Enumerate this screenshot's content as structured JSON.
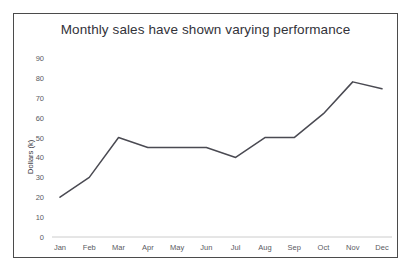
{
  "chart_data": {
    "type": "line",
    "title": "Monthly sales have shown varying performance",
    "xlabel": "",
    "ylabel": "Dollars (k)",
    "categories": [
      "Jan",
      "Feb",
      "Mar",
      "Apr",
      "May",
      "Jun",
      "Jul",
      "Aug",
      "Sep",
      "Oct",
      "Nov",
      "Dec"
    ],
    "values": [
      20,
      30,
      50,
      45,
      45,
      45,
      40,
      50,
      50,
      62,
      78,
      74.5
    ],
    "series": [
      {
        "name": "Monthly sales",
        "values": [
          20,
          30,
          50,
          45,
          45,
          45,
          40,
          50,
          50,
          62,
          78,
          74.5
        ]
      }
    ],
    "ylim": [
      0,
      90
    ],
    "y_ticks": [
      0,
      10,
      20,
      30,
      40,
      50,
      60,
      70,
      80,
      90
    ],
    "y_tick_labels": [
      "0",
      "10",
      "20",
      "30",
      "40",
      "50",
      "60",
      "70",
      "80",
      "90"
    ],
    "grid": false,
    "legend": false,
    "legend_position": "none",
    "line_color": "#4a4a52",
    "axis_color": "#cccccc",
    "text_color": "#5a5a62",
    "title_color": "#33333a",
    "background_color": "#ffffff",
    "border_color": "#4b4b4b"
  }
}
